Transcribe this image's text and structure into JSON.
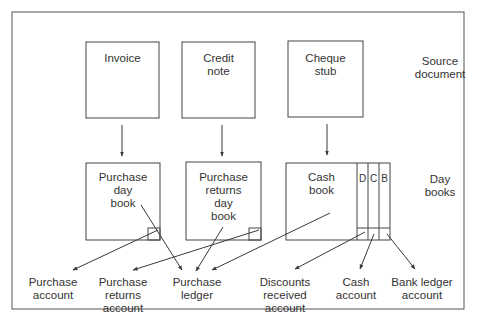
{
  "diagram": {
    "title": "",
    "row_labels": {
      "source": "Source\ndocument",
      "daybooks": "Day\nbooks"
    },
    "source_documents": [
      {
        "id": "invoice",
        "label": "Invoice"
      },
      {
        "id": "credit-note",
        "label": "Credit\nnote"
      },
      {
        "id": "cheque-stub",
        "label": "Cheque\nstub"
      }
    ],
    "day_books": [
      {
        "id": "purchase-day-book",
        "label": "Purchase\nday\nbook"
      },
      {
        "id": "purchase-returns-day-book",
        "label": "Purchase\nreturns\nday\nbook"
      },
      {
        "id": "cash-book",
        "label": "Cash\nbook"
      }
    ],
    "cash_book_columns": [
      "D",
      "C",
      "B"
    ],
    "accounts": [
      {
        "id": "purchase-account",
        "label": "Purchase\naccount"
      },
      {
        "id": "purchase-returns-account",
        "label": "Purchase\nreturns\naccount"
      },
      {
        "id": "purchase-ledger",
        "label": "Purchase\nledger"
      },
      {
        "id": "discounts-received-account",
        "label": "Discounts\nreceived\naccount"
      },
      {
        "id": "cash-account",
        "label": "Cash\naccount"
      },
      {
        "id": "bank-ledger-account",
        "label": "Bank ledger\naccount"
      }
    ],
    "colors": {
      "line": "#3a3a3a",
      "frame": "#555555",
      "text": "#333333"
    }
  }
}
